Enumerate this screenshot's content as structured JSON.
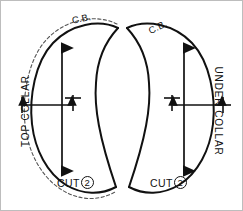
{
  "diagram": {
    "line_color": "#111111",
    "seam_allowance_color": "#555555",
    "background": "#ffffff",
    "border_color": "#bdbdbd"
  },
  "pieces": [
    {
      "id": "top-collar",
      "name": "TOP COLLAR",
      "center_back_label": "C.B.",
      "cut_label": "CUT",
      "cut_quantity": "2",
      "has_seam_allowance_line": true,
      "grainline": "vertical double arrow",
      "width_arrow": "horizontal double arrow"
    },
    {
      "id": "under-collar",
      "name": "UNDER COLLAR",
      "center_back_label": "C.B.",
      "cut_label": "CUT",
      "cut_quantity": "2",
      "has_seam_allowance_line": false,
      "grainline": "vertical double arrow",
      "width_arrow": "horizontal double arrow"
    }
  ]
}
